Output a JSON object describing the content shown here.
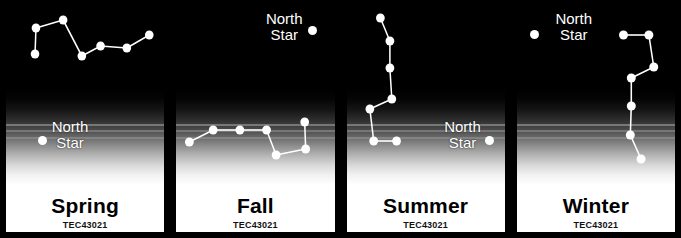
{
  "poster": {
    "title": "Seasonal Big Dipper and North Star panels",
    "background_color": "#000000",
    "star_color": "#ffffff",
    "sky_color": "#000000",
    "ground_color": "#ffffff"
  },
  "panels": [
    {
      "season_label": "Spring",
      "code_label": "TEC43021",
      "north_star": {
        "label_line1": "North",
        "label_line2": "Star",
        "dot_x": 39,
        "dot_y": 134,
        "label_x": 67,
        "label_y": 113
      },
      "constellation": {
        "name": "Big Dipper",
        "stars": [
          {
            "x": 34,
            "y": 48
          },
          {
            "x": 35,
            "y": 22
          },
          {
            "x": 64,
            "y": 14
          },
          {
            "x": 84,
            "y": 50
          },
          {
            "x": 104,
            "y": 40
          },
          {
            "x": 132,
            "y": 42
          },
          {
            "x": 156,
            "y": 29
          }
        ],
        "links": [
          [
            0,
            1
          ],
          [
            1,
            2
          ],
          [
            2,
            3
          ],
          [
            3,
            4
          ],
          [
            4,
            5
          ],
          [
            5,
            6
          ]
        ]
      }
    },
    {
      "season_label": "Fall",
      "code_label": "TEC43021",
      "north_star": {
        "label_line1": "North",
        "label_line2": "Star",
        "dot_x": 314,
        "dot_y": 24,
        "label_x": 286,
        "label_y": 5
      },
      "constellation": {
        "name": "Big Dipper",
        "stars": [
          {
            "x": 192,
            "y": 136
          },
          {
            "x": 217,
            "y": 124
          },
          {
            "x": 245,
            "y": 124
          },
          {
            "x": 273,
            "y": 124
          },
          {
            "x": 283,
            "y": 149
          },
          {
            "x": 314,
            "y": 143
          },
          {
            "x": 313,
            "y": 116
          }
        ],
        "links": [
          [
            0,
            1
          ],
          [
            1,
            2
          ],
          [
            2,
            3
          ],
          [
            3,
            4
          ],
          [
            4,
            5
          ],
          [
            5,
            6
          ]
        ]
      }
    },
    {
      "season_label": "Summer",
      "code_label": "TEC43021",
      "north_star": {
        "label_line1": "North",
        "label_line2": "Star",
        "dot_x": 491,
        "dot_y": 134,
        "label_x": 464,
        "label_y": 113
      },
      "constellation": {
        "name": "Big Dipper",
        "stars": [
          {
            "x": 383,
            "y": 12
          },
          {
            "x": 393,
            "y": 35
          },
          {
            "x": 393,
            "y": 62
          },
          {
            "x": 395,
            "y": 93
          },
          {
            "x": 372,
            "y": 103
          },
          {
            "x": 376,
            "y": 135
          },
          {
            "x": 400,
            "y": 135
          }
        ],
        "links": [
          [
            0,
            1
          ],
          [
            1,
            2
          ],
          [
            2,
            3
          ],
          [
            3,
            4
          ],
          [
            4,
            5
          ],
          [
            5,
            6
          ]
        ]
      }
    },
    {
      "season_label": "Winter",
      "code_label": "TEC43021",
      "north_star": {
        "label_line1": "North",
        "label_line2": "Star",
        "dot_x": 534,
        "dot_y": 28,
        "label_x": 573,
        "label_y": 5
      },
      "constellation": {
        "name": "Big Dipper",
        "stars": [
          {
            "x": 625,
            "y": 29
          },
          {
            "x": 651,
            "y": 29
          },
          {
            "x": 656,
            "y": 61
          },
          {
            "x": 633,
            "y": 72
          },
          {
            "x": 633,
            "y": 100
          },
          {
            "x": 632,
            "y": 129
          },
          {
            "x": 643,
            "y": 153
          }
        ],
        "links": [
          [
            0,
            1
          ],
          [
            1,
            2
          ],
          [
            2,
            3
          ],
          [
            3,
            4
          ],
          [
            4,
            5
          ],
          [
            5,
            6
          ]
        ]
      }
    }
  ],
  "panel_geometry": {
    "bounds": [
      {
        "left": 3,
        "width": 169
      },
      {
        "left": 178,
        "width": 166
      },
      {
        "left": 348,
        "width": 166
      },
      {
        "left": 516,
        "width": 162
      }
    ]
  }
}
